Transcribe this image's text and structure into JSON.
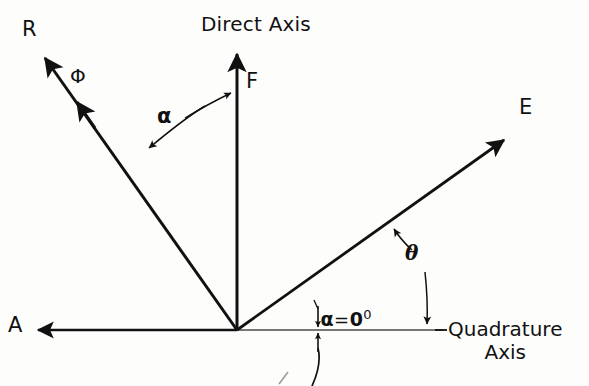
{
  "figure": {
    "type": "vector-phasor-diagram",
    "background_color": "#fdfdfc",
    "stroke_color": "#111111",
    "width": 589,
    "height": 386
  },
  "axes": {
    "direct": {
      "label": "Direct Axis",
      "orientation": "vertical-up",
      "label_position": {
        "x": 201,
        "y": 14
      }
    },
    "quadrature": {
      "label_line1": "Quadrature",
      "label_line2": "Axis",
      "orientation": "horizontal-right",
      "label_position": {
        "x": 448,
        "y": 318
      }
    }
  },
  "origin": {
    "x": 237,
    "y": 330
  },
  "vectors": [
    {
      "name": "R",
      "label": "R",
      "label_position": {
        "x": 22,
        "y": 18
      },
      "tip": {
        "x": 41,
        "y": 53
      },
      "tail": {
        "x": 237,
        "y": 330
      },
      "angle_from_direct_axis_deg": 35,
      "double_arrowhead": true,
      "secondary_label": "Φ",
      "secondary_label_position": {
        "x": 70,
        "y": 68
      }
    },
    {
      "name": "F",
      "label": "F",
      "label_position": {
        "x": 246,
        "y": 70
      },
      "tip": {
        "x": 237,
        "y": 50
      },
      "tail": {
        "x": 237,
        "y": 330
      },
      "angle_from_direct_axis_deg": 0,
      "double_arrowhead": false
    },
    {
      "name": "E",
      "label": "E",
      "label_position": {
        "x": 519,
        "y": 96
      },
      "tip": {
        "x": 508,
        "y": 136
      },
      "tail": {
        "x": 237,
        "y": 330
      },
      "angle_from_quadrature_axis_deg": 36,
      "double_arrowhead": false
    },
    {
      "name": "A",
      "label": "A",
      "label_position": {
        "x": 8,
        "y": 317
      },
      "tip": {
        "x": 34,
        "y": 330
      },
      "tail": {
        "x": 237,
        "y": 330
      },
      "angle_from_quadrature_axis_deg": 180,
      "double_arrowhead": false
    }
  ],
  "angles": [
    {
      "name": "alpha",
      "symbol": "α",
      "label_position": {
        "x": 157,
        "y": 108
      },
      "between": [
        "R",
        "F"
      ],
      "arrow_style": "double-headed-arc"
    },
    {
      "name": "theta",
      "symbol": "θ",
      "label_position": {
        "x": 405,
        "y": 243
      },
      "between": [
        "E",
        "Quadrature Axis"
      ],
      "arrow_style": "double-headed-arc"
    },
    {
      "name": "alpha-zero",
      "symbol": "α",
      "equals": "=",
      "value": "0",
      "degree": "0",
      "label_position": {
        "x": 292,
        "y": 288
      },
      "between": [
        "Quadrature Axis",
        "Quadrature Axis"
      ],
      "arrow_style": "double-headed-short-vertical",
      "note": "zero-angle marker on quadrature axis with leader line"
    }
  ],
  "caption": {
    "text": "",
    "clipped": true,
    "position": {
      "x": 110,
      "y": 374
    }
  }
}
